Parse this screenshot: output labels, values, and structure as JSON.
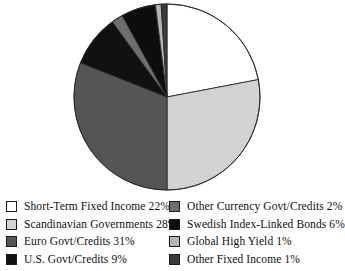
{
  "chart_data": {
    "type": "pie",
    "title": "",
    "subtitle": "",
    "xlabel": "",
    "ylabel": "",
    "legend_position": "bottom",
    "grid": false,
    "units": "%",
    "total": 100,
    "start_angle_deg": 0,
    "direction": "clockwise",
    "categories": [
      "Short-Term Fixed Income",
      "Scandinavian Governments",
      "Euro Govt/Credits",
      "U.S. Govt/Credits",
      "Other Currency Govt/Credits",
      "Swedish Index-Linked Bonds",
      "Global High Yield",
      "Other Fixed Income"
    ],
    "values": [
      22,
      28,
      31,
      9,
      2,
      6,
      1,
      1
    ],
    "colors": [
      "#ffffff",
      "#d2d2d2",
      "#555555",
      "#111111",
      "#6e6e6e",
      "#0d0d0d",
      "#b4b4b4",
      "#3a3a3a"
    ],
    "slices": [
      {
        "label": "Short-Term Fixed Income",
        "value": 22,
        "display": "22%",
        "color": "#ffffff"
      },
      {
        "label": "Scandinavian Governments",
        "value": 28,
        "display": "28%",
        "color": "#d2d2d2"
      },
      {
        "label": "Euro Govt/Credits",
        "value": 31,
        "display": "31%",
        "color": "#555555"
      },
      {
        "label": "U.S. Govt/Credits",
        "value": 9,
        "display": "9%",
        "color": "#111111"
      },
      {
        "label": "Other Currency Govt/Credits",
        "value": 2,
        "display": "2%",
        "color": "#6e6e6e"
      },
      {
        "label": "Swedish Index-Linked Bonds",
        "value": 6,
        "display": "6%",
        "color": "#0d0d0d"
      },
      {
        "label": "Global High Yield",
        "value": 1,
        "display": "1%",
        "color": "#b4b4b4"
      },
      {
        "label": "Other Fixed Income",
        "value": 1,
        "display": "1%",
        "color": "#3a3a3a"
      }
    ]
  },
  "legend": {
    "columns": [
      {
        "entries": [
          {
            "swatch_name": "legend-swatch-short-term-fixed-income",
            "color": "#ffffff",
            "text": "Short-Term Fixed Income 22%"
          },
          {
            "swatch_name": "legend-swatch-scandinavian-governments",
            "color": "#d2d2d2",
            "text": "Scandinavian Governments 28%"
          },
          {
            "swatch_name": "legend-swatch-euro-govt-credits",
            "color": "#555555",
            "text": "Euro Govt/Credits 31%"
          },
          {
            "swatch_name": "legend-swatch-us-govt-credits",
            "color": "#111111",
            "text": "U.S. Govt/Credits 9%"
          }
        ]
      },
      {
        "entries": [
          {
            "swatch_name": "legend-swatch-other-currency-govt-credits",
            "color": "#6e6e6e",
            "text": "Other Currency Govt/Credits 2%"
          },
          {
            "swatch_name": "legend-swatch-swedish-index-linked-bonds",
            "color": "#0d0d0d",
            "text": "Swedish Index-Linked Bonds 6%"
          },
          {
            "swatch_name": "legend-swatch-global-high-yield",
            "color": "#b4b4b4",
            "text": "Global High Yield 1%"
          },
          {
            "swatch_name": "legend-swatch-other-fixed-income",
            "color": "#3a3a3a",
            "text": "Other Fixed Income 1%"
          }
        ]
      }
    ]
  },
  "pie_geometry": {
    "cx": 167,
    "cy": 97,
    "r": 93,
    "stroke": "#2a2a2a",
    "stroke_width": 0.9
  }
}
